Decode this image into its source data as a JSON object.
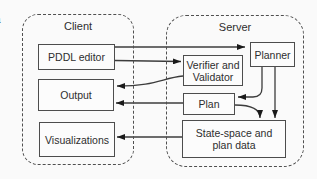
{
  "figure_label": "a",
  "client": {
    "title": "Client",
    "boxes": {
      "pddl_editor": {
        "label": "PDDL editor"
      },
      "output": {
        "label": "Output"
      },
      "visualizations": {
        "label": "Visualizations"
      }
    }
  },
  "server": {
    "title": "Server",
    "boxes": {
      "planner": {
        "label": "Planner"
      },
      "verifier_validator": {
        "line1": "Verifier and",
        "line2": "Validator"
      },
      "plan": {
        "label": "Plan"
      },
      "state_space": {
        "line1": "State-space and",
        "line2": "plan data"
      }
    }
  },
  "connections": [
    {
      "from": "PDDL editor",
      "to": "Planner"
    },
    {
      "from": "PDDL editor",
      "to": "Verifier and Validator"
    },
    {
      "from": "Verifier and Validator",
      "to": "Output"
    },
    {
      "from": "Plan",
      "to": "Output"
    },
    {
      "from": "State-space and plan data",
      "to": "Visualizations"
    },
    {
      "from": "Planner",
      "to": "Plan"
    },
    {
      "from": "Plan",
      "to": "State-space and plan data"
    },
    {
      "from": "Planner",
      "to": "State-space and plan data"
    }
  ],
  "colors": {
    "background": "#fafafa",
    "line": "#3c3c3c",
    "box_border": "#4d4d4d",
    "text": "#2e2e2e"
  }
}
